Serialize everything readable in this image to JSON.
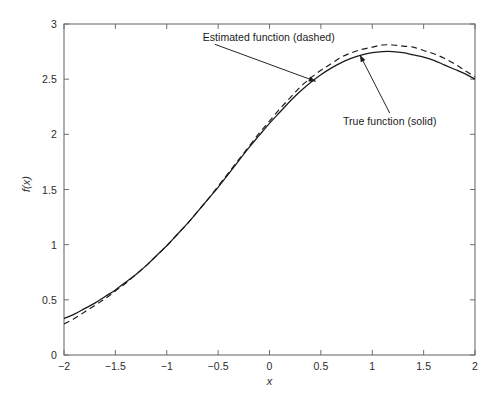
{
  "chart_data": {
    "type": "line",
    "title": "",
    "xlabel": "x",
    "ylabel": "f(x)",
    "xlim": [
      -2,
      2
    ],
    "ylim": [
      0,
      3
    ],
    "xticks": [
      -2,
      -1.5,
      -1,
      -0.5,
      0,
      0.5,
      1,
      1.5,
      2
    ],
    "xtick_labels": [
      "−2",
      "−1.5",
      "−1",
      "−0.5",
      "0",
      "0.5",
      "1",
      "1.5",
      "2"
    ],
    "yticks": [
      0,
      0.5,
      1,
      1.5,
      2,
      2.5,
      3
    ],
    "ytick_labels": [
      "0",
      "0.5",
      "1",
      "1.5",
      "2",
      "2.5",
      "3"
    ],
    "grid": false,
    "legend_position": "inline-annotations",
    "series": [
      {
        "name": "True function (solid)",
        "style": "solid",
        "color": "#1a1a1a",
        "x": [
          -2,
          -1.9,
          -1.8,
          -1.7,
          -1.6,
          -1.5,
          -1.4,
          -1.3,
          -1.2,
          -1.1,
          -1,
          -0.9,
          -0.8,
          -0.7,
          -0.6,
          -0.5,
          -0.4,
          -0.3,
          -0.2,
          -0.1,
          0,
          0.1,
          0.2,
          0.3,
          0.4,
          0.5,
          0.6,
          0.7,
          0.8,
          0.9,
          1,
          1.1,
          1.2,
          1.3,
          1.4,
          1.5,
          1.6,
          1.7,
          1.8,
          1.9,
          2
        ],
        "values": [
          0.33,
          0.37,
          0.42,
          0.47,
          0.53,
          0.59,
          0.66,
          0.73,
          0.81,
          0.9,
          0.99,
          1.09,
          1.19,
          1.3,
          1.41,
          1.52,
          1.64,
          1.76,
          1.88,
          1.99,
          2.1,
          2.2,
          2.3,
          2.39,
          2.47,
          2.54,
          2.6,
          2.65,
          2.69,
          2.72,
          2.74,
          2.75,
          2.75,
          2.74,
          2.72,
          2.7,
          2.67,
          2.63,
          2.59,
          2.55,
          2.5
        ]
      },
      {
        "name": "Estimated function (dashed)",
        "style": "dashed",
        "color": "#1a1a1a",
        "x": [
          -2,
          -1.9,
          -1.8,
          -1.7,
          -1.6,
          -1.5,
          -1.4,
          -1.3,
          -1.2,
          -1.1,
          -1,
          -0.9,
          -0.8,
          -0.7,
          -0.6,
          -0.5,
          -0.4,
          -0.3,
          -0.2,
          -0.1,
          0,
          0.1,
          0.2,
          0.3,
          0.4,
          0.5,
          0.6,
          0.7,
          0.8,
          0.9,
          1,
          1.1,
          1.2,
          1.3,
          1.4,
          1.5,
          1.6,
          1.7,
          1.8,
          1.9,
          2
        ],
        "values": [
          0.28,
          0.33,
          0.39,
          0.45,
          0.51,
          0.58,
          0.65,
          0.73,
          0.81,
          0.9,
          0.99,
          1.09,
          1.19,
          1.3,
          1.41,
          1.53,
          1.65,
          1.77,
          1.89,
          2.01,
          2.12,
          2.23,
          2.33,
          2.43,
          2.51,
          2.58,
          2.64,
          2.7,
          2.74,
          2.77,
          2.79,
          2.81,
          2.81,
          2.8,
          2.79,
          2.76,
          2.73,
          2.69,
          2.64,
          2.58,
          2.52
        ]
      }
    ],
    "annotations": [
      {
        "text": "Estimated function (dashed)",
        "text_x": -0.65,
        "text_y": 2.88,
        "points_to_x": 0.45,
        "points_to_y": 2.48
      },
      {
        "text": "True function (solid)",
        "text_x": 1.17,
        "text_y": 2.12,
        "points_to_x": 0.88,
        "points_to_y": 2.72
      }
    ]
  }
}
